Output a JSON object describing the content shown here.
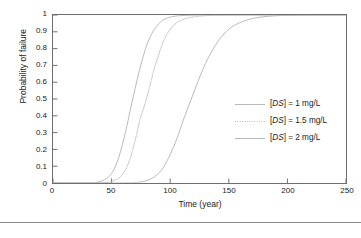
{
  "chart_data": {
    "type": "line",
    "title": "",
    "xlabel": "Time (year)",
    "ylabel": "Probability of failure",
    "xlim": [
      0,
      250
    ],
    "ylim": [
      0,
      1
    ],
    "xticks": [
      0,
      50,
      100,
      150,
      200,
      250
    ],
    "yticks": [
      0,
      0.1,
      0.2,
      0.3,
      0.4,
      0.5,
      0.6,
      0.7,
      0.8,
      0.9,
      1
    ],
    "ytick_labels": [
      "0",
      "0.1",
      "0.2",
      "0.3",
      "0.4",
      "0.5",
      "0.6",
      "0.7",
      "0.8",
      "0.9",
      "1"
    ],
    "xtick_labels": [
      "0",
      "50",
      "100",
      "150",
      "200",
      "250"
    ],
    "grid": false,
    "legend_position": "center-right",
    "line_color": "#b9b9b9",
    "frame_color": "#6e6e6e",
    "series": [
      {
        "name": "[DS] = 2 mg/L",
        "label_prefix": "[",
        "label_italic": "DS",
        "label_suffix": "] = 2 mg/L",
        "style": "solid",
        "midpoint_year": 70,
        "x": [
          0,
          30,
          38,
          44,
          48,
          52,
          56,
          60,
          64,
          68,
          72,
          76,
          80,
          84,
          88,
          92,
          96,
          104,
          115,
          130,
          160,
          200,
          250
        ],
        "y": [
          0,
          0.0,
          0.005,
          0.02,
          0.04,
          0.08,
          0.15,
          0.25,
          0.37,
          0.5,
          0.62,
          0.73,
          0.82,
          0.885,
          0.93,
          0.96,
          0.978,
          0.993,
          0.998,
          1.0,
          1.0,
          1.0,
          1.0
        ]
      },
      {
        "name": "[DS] = 1.5 mg/L",
        "label_prefix": "[",
        "label_italic": "DS",
        "label_suffix": "] = 1.5 mg/L",
        "style": "dotted",
        "midpoint_year": 82,
        "x": [
          0,
          38,
          48,
          54,
          58,
          62,
          66,
          70,
          74,
          78,
          82,
          86,
          90,
          94,
          98,
          104,
          110,
          118,
          130,
          145,
          170,
          210,
          250
        ],
        "y": [
          0,
          0.0,
          0.006,
          0.02,
          0.04,
          0.08,
          0.15,
          0.25,
          0.37,
          0.46,
          0.56,
          0.67,
          0.76,
          0.84,
          0.895,
          0.945,
          0.97,
          0.987,
          0.996,
          0.999,
          1.0,
          1.0,
          1.0
        ]
      },
      {
        "name": "[DS] = 1 mg/L",
        "label_prefix": "[",
        "label_italic": "DS",
        "label_suffix": "] = 1 mg/L",
        "style": "solid",
        "midpoint_year": 118,
        "x": [
          0,
          62,
          74,
          82,
          88,
          94,
          100,
          106,
          112,
          118,
          124,
          130,
          136,
          142,
          150,
          158,
          168,
          180,
          195,
          212,
          230,
          250
        ],
        "y": [
          0,
          0.0,
          0.006,
          0.02,
          0.045,
          0.09,
          0.17,
          0.27,
          0.39,
          0.5,
          0.61,
          0.71,
          0.79,
          0.855,
          0.915,
          0.95,
          0.975,
          0.99,
          0.997,
          0.999,
          1.0,
          1.0
        ]
      }
    ]
  },
  "legend": {
    "items": [
      {
        "text": "[DS] = 1 mg/L",
        "pre": "[",
        "em": "DS",
        "post": "] = 1 mg/L",
        "style": "solid"
      },
      {
        "text": "[DS] = 1.5 mg/L",
        "pre": "[",
        "em": "DS",
        "post": "] = 1.5 mg/L",
        "style": "dotted"
      },
      {
        "text": "[DS] = 2 mg/L",
        "pre": "[",
        "em": "DS",
        "post": "] = 2 mg/L",
        "style": "solid"
      }
    ]
  },
  "page": {
    "footer_faint": ""
  }
}
